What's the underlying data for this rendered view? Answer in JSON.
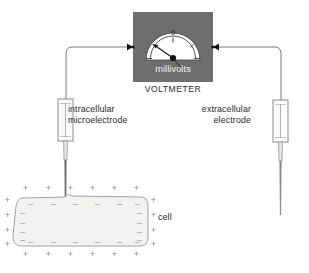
{
  "diagram": {
    "title_visible": false,
    "background_color": "#ffffff"
  },
  "voltmeter": {
    "body_label": "millivolts",
    "caption": "VOLTMETER",
    "body_color": "#6e6e6e",
    "face_color": "#ffffff",
    "scale_zero_label": "0",
    "needle_deflection": "left-of-zero",
    "terminals": [
      {
        "name": "left-terminal",
        "side": "left"
      },
      {
        "name": "right-terminal",
        "side": "right"
      }
    ]
  },
  "electrodes": {
    "left": {
      "label_line1": "intracellular",
      "label_line2": "microelectrode",
      "penetrates_cell": true
    },
    "right": {
      "label_line1": "extracellular",
      "label_line2": "electrode",
      "penetrates_cell": false
    }
  },
  "cell": {
    "label": "cell",
    "fill_color": "#f2f2f0",
    "membrane_color": "#9a9a9a",
    "outside_charge": "+",
    "inside_charge": "–",
    "outside_signs_top": [
      "+",
      "+",
      "+",
      "+",
      "+",
      "+"
    ],
    "outside_signs_bottom": [
      "+",
      "+",
      "+",
      "+",
      "+",
      "+"
    ],
    "outside_signs_left": [
      "+",
      "+",
      "+",
      "+"
    ],
    "outside_signs_right": [
      "+",
      "+",
      "+",
      "+"
    ],
    "inside_signs_top": [
      "–",
      "–",
      "–",
      "–",
      "–",
      "–"
    ],
    "inside_signs_bottom": [
      "–",
      "–",
      "–",
      "–",
      "–",
      "–"
    ],
    "inside_signs_left": [
      "–",
      "–",
      "–",
      "–"
    ],
    "inside_signs_right": [
      "–",
      "–",
      "–",
      "–"
    ]
  },
  "wires": {
    "color": "#6b6b6b",
    "left_wire_name": "wire-to-intracellular-electrode",
    "right_wire_name": "wire-to-extracellular-electrode"
  }
}
